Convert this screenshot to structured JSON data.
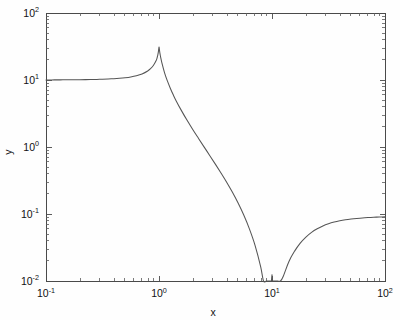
{
  "chart_data": {
    "type": "line",
    "title": "",
    "subtitle": "",
    "xlabel": "x",
    "ylabel": "y",
    "xscale": "log",
    "yscale": "log",
    "xlim": [
      0.1,
      100
    ],
    "ylim": [
      0.01,
      100
    ],
    "grid": false,
    "legend": null,
    "xtick_labels": [
      "10^-1",
      "10^0",
      "10^1",
      "10^2"
    ],
    "xtick_values": [
      0.1,
      1,
      10,
      100
    ],
    "ytick_labels": [
      "10^-2",
      "10^-1",
      "10^0",
      "10^1",
      "10^2"
    ],
    "ytick_values": [
      0.01,
      0.1,
      1,
      10,
      100
    ],
    "xtick_bases": [
      "10",
      "10",
      "10",
      "10"
    ],
    "xtick_exponents": [
      "-1",
      "0",
      "1",
      "2"
    ],
    "ytick_bases": [
      "10",
      "10",
      "10",
      "10",
      "10"
    ],
    "ytick_exponents": [
      "-2",
      "-1",
      "0",
      "1",
      "2"
    ],
    "annotations": [
      {
        "label": "resonance peak",
        "x": 1.0,
        "y": 31.0
      },
      {
        "label": "anti-resonance notch",
        "x": 10.0,
        "y": 0.0125
      },
      {
        "label": "low-frequency plateau",
        "x": 0.1,
        "y": 10.0
      },
      {
        "label": "high-frequency plateau",
        "x": 100.0,
        "y": 0.1
      }
    ],
    "series": [
      {
        "name": "transfer function",
        "color": "#555555",
        "x": [
          0.1,
          0.1122,
          0.1259,
          0.1413,
          0.1585,
          0.1778,
          0.1995,
          0.2239,
          0.2512,
          0.2818,
          0.3162,
          0.3548,
          0.3981,
          0.4467,
          0.5012,
          0.5623,
          0.631,
          0.7079,
          0.7943,
          0.8414,
          0.8913,
          0.9441,
          0.9661,
          0.9772,
          0.9886,
          1.0,
          1.0116,
          1.0233,
          1.0351,
          1.0593,
          1.122,
          1.1885,
          1.2589,
          1.3335,
          1.4125,
          1.5849,
          1.7783,
          1.9953,
          2.2387,
          2.5119,
          2.8184,
          3.1623,
          3.548,
          3.9811,
          4.4668,
          5.0119,
          5.6234,
          6.3096,
          7.0795,
          7.9433,
          8.4139,
          8.9125,
          9.3325,
          9.5499,
          9.7724,
          9.8855,
          10.0,
          10.1158,
          10.233,
          10.4713,
          10.7152,
          11.22,
          11.885,
          12.589,
          14.125,
          15.849,
          17.783,
          19.953,
          22.387,
          25.119,
          28.184,
          31.623,
          35.481,
          39.811,
          44.668,
          50.119,
          56.234,
          63.096,
          70.795,
          79.433,
          89.125,
          100.0
        ],
        "y": [
          10.02,
          10.03,
          10.04,
          10.05,
          10.06,
          10.08,
          10.1,
          10.13,
          10.17,
          10.21,
          10.27,
          10.35,
          10.46,
          10.61,
          10.82,
          11.12,
          11.58,
          12.31,
          13.62,
          14.76,
          16.49,
          19.52,
          22.04,
          23.84,
          26.76,
          31.0,
          27.2,
          24.1,
          21.7,
          18.2,
          12.7,
          9.62,
          7.55,
          6.06,
          4.96,
          3.46,
          2.48,
          1.81,
          1.34,
          0.996,
          0.742,
          0.551,
          0.406,
          0.296,
          0.211,
          0.146,
          0.0965,
          0.0601,
          0.0341,
          0.0163,
          0.00954,
          0.00405,
          0.00114,
          0.00052,
          0.00018,
          8e-05,
          0.0125,
          0.00022,
          0.00061,
          0.00148,
          0.00255,
          0.00502,
          0.00862,
          0.0118,
          0.0196,
          0.0279,
          0.0368,
          0.0453,
          0.0533,
          0.0603,
          0.0664,
          0.0715,
          0.0757,
          0.0791,
          0.0819,
          0.0841,
          0.0859,
          0.0874,
          0.0885,
          0.0894,
          0.0901,
          0.0907
        ]
      }
    ]
  },
  "figure": {
    "background_color": "#fefefe",
    "axes_color": "#4a4a4a",
    "curve_color": "#555555",
    "text_color": "#111111"
  }
}
